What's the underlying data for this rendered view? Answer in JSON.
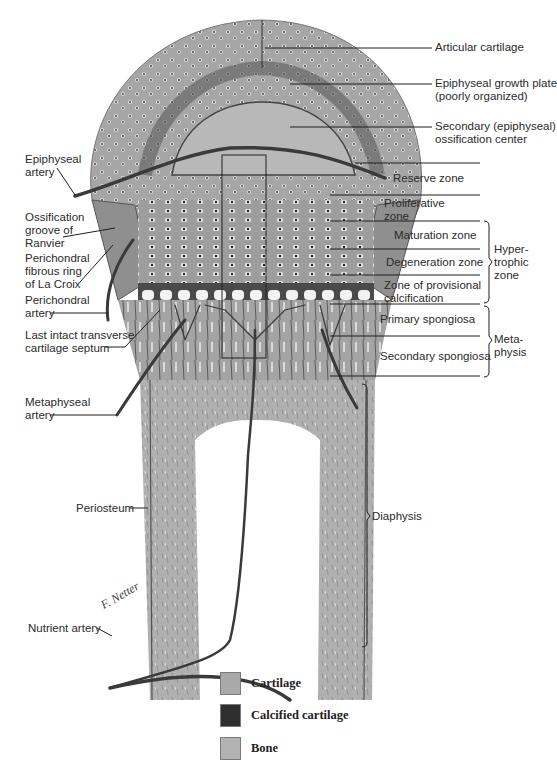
{
  "diagram": {
    "labels_right": {
      "articular_cartilage": "Articular cartilage",
      "epiphyseal_growth_plate_1": "Epiphyseal growth plate",
      "epiphyseal_growth_plate_2": "(poorly organized)",
      "secondary_ossification_1": "Secondary (epiphyseal)",
      "secondary_ossification_2": "ossification center",
      "reserve_zone": "Reserve zone",
      "proliferative_zone_1": "Proliferative",
      "proliferative_zone_2": "zone",
      "maturation_zone": "Maturation zone",
      "degeneration_zone": "Degeneration zone",
      "provisional_calcification_1": "Zone of provisional",
      "provisional_calcification_2": "calcification",
      "primary_spongiosa": "Primary spongiosa",
      "secondary_spongiosa": "Secondary spongiosa"
    },
    "brackets": {
      "hypertrophic_1": "Hyper-",
      "hypertrophic_2": "trophic",
      "hypertrophic_3": "zone",
      "metaphysis_1": "Meta-",
      "metaphysis_2": "physis",
      "diaphysis": "Diaphysis"
    },
    "labels_left": {
      "epiphyseal_artery_1": "Epiphyseal",
      "epiphyseal_artery_2": "artery",
      "ossification_groove_1": "Ossification",
      "ossification_groove_2": "groove of",
      "ossification_groove_3": "Ranvier",
      "perichondral_ring_1": "Perichondral",
      "perichondral_ring_2": "fibrous ring",
      "perichondral_ring_3": "of La Croix",
      "perichondral_artery_1": "Perichondral",
      "perichondral_artery_2": "artery",
      "last_septum_1": "Last intact transverse",
      "last_septum_2": "cartilage septum",
      "metaphyseal_artery_1": "Metaphyseal",
      "metaphyseal_artery_2": "artery",
      "periosteum": "Periosteum",
      "nutrient_artery": "Nutrient artery"
    },
    "signature": "F. Netter M.D."
  },
  "legend": {
    "items": [
      {
        "label": "Cartilage",
        "color": "#a9a9a9"
      },
      {
        "label": "Calcified cartilage",
        "color": "#2f2f2f"
      },
      {
        "label": "Bone",
        "color": "#b3b3b3"
      }
    ]
  },
  "colors": {
    "cartilage": "#a8a8a8",
    "bone": "#b0b0b0",
    "vessel": "#3a3a3a",
    "line": "#1e1e1e"
  }
}
